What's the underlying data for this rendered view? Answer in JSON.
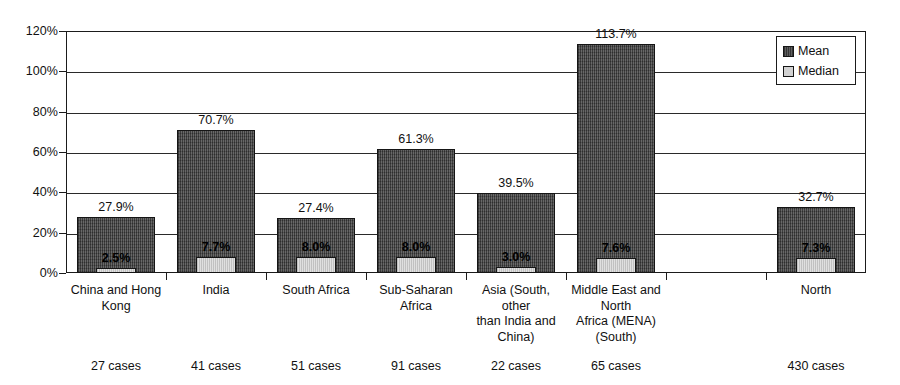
{
  "chart_data": {
    "type": "bar",
    "title": "",
    "xlabel": "",
    "ylabel": "",
    "ylim": [
      0,
      120
    ],
    "grid": true,
    "legend_position": "top-right",
    "y_ticks": [
      "0%",
      "20%",
      "40%",
      "60%",
      "80%",
      "100%",
      "120%"
    ],
    "y_tick_values": [
      0,
      20,
      40,
      60,
      80,
      100,
      120
    ],
    "categories": [
      "China and Hong Kong",
      "India",
      "South Africa",
      "Sub-Saharan Africa",
      "Asia (South, other than India and China)",
      "Middle East and North Africa (MENA) (South)",
      "",
      "North"
    ],
    "category_lines": [
      [
        "China and Hong",
        "Kong"
      ],
      [
        "India"
      ],
      [
        "South Africa"
      ],
      [
        "Sub-Saharan",
        "Africa"
      ],
      [
        "Asia (South, other",
        "than India and",
        "China)"
      ],
      [
        "Middle East and",
        "North",
        "Africa (MENA)",
        "(South)"
      ],
      [
        ""
      ],
      [
        "North"
      ]
    ],
    "case_counts": [
      "27 cases",
      "41 cases",
      "51 cases",
      "91 cases",
      "22 cases",
      "65 cases",
      "",
      "430 cases"
    ],
    "series": [
      {
        "name": "Mean",
        "color": "#4d4d4d",
        "values": [
          27.9,
          70.7,
          27.4,
          61.3,
          39.5,
          113.7,
          null,
          32.7
        ],
        "labels": [
          "27.9%",
          "70.7%",
          "27.4%",
          "61.3%",
          "39.5%",
          "113.7%",
          "",
          "32.7%"
        ]
      },
      {
        "name": "Median",
        "color": "#cfcfcf",
        "values": [
          2.5,
          7.7,
          8.0,
          8.0,
          3.0,
          7.6,
          null,
          7.3
        ],
        "labels": [
          "2.5%",
          "7.7%",
          "8.0%",
          "8.0%",
          "3.0%",
          "7.6%",
          "",
          "7.3%"
        ]
      }
    ]
  },
  "legend": {
    "items": [
      {
        "label": "Mean",
        "swatch": "mean"
      },
      {
        "label": "Median",
        "swatch": "median"
      }
    ]
  }
}
